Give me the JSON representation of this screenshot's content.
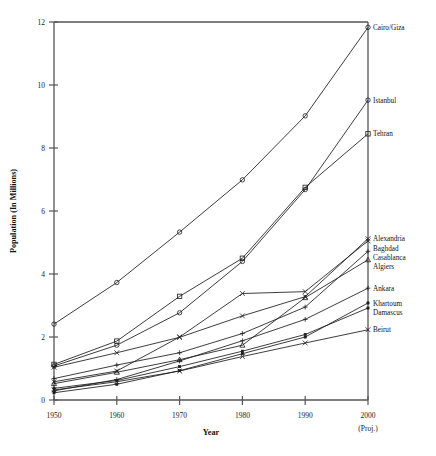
{
  "chart_data": {
    "type": "line",
    "title": "",
    "xlabel": "Year",
    "ylabel": "Population (In Millions)",
    "x": [
      1950,
      1960,
      1970,
      1980,
      1990,
      2000
    ],
    "xtick_labels": [
      "1950",
      "1960",
      "1970",
      "1980",
      "1990",
      "2000"
    ],
    "xtick_sublabel_last": "(Proj.)",
    "ytick_labels": [
      "0",
      "2",
      "4",
      "6",
      "8",
      "10",
      "12"
    ],
    "ytick_values": [
      0,
      2,
      4,
      6,
      8,
      10,
      12
    ],
    "ylim": [
      0,
      12
    ],
    "xlim": [
      1950,
      2000
    ],
    "grid": false,
    "legend_position": "right-of-plot-endpoint-labels",
    "series": [
      {
        "name": "Cairo/Giza",
        "label": "Cairo/Giza",
        "marker": "circle",
        "values": [
          2.41,
          3.73,
          5.33,
          6.99,
          9.02,
          11.83
        ]
      },
      {
        "name": "Istanbul",
        "label": "Istanbul",
        "marker": "circle",
        "values": [
          1.08,
          1.74,
          2.77,
          4.4,
          6.68,
          9.52
        ]
      },
      {
        "name": "Tehran",
        "label": "Tehran",
        "marker": "square",
        "values": [
          1.13,
          1.87,
          3.29,
          4.5,
          6.75,
          8.45
        ]
      },
      {
        "name": "Alexandria",
        "label": "Alexandria",
        "marker": "cross",
        "values": [
          1.04,
          1.5,
          1.99,
          2.67,
          3.28,
          5.12
        ]
      },
      {
        "name": "Baghdad",
        "label": "Baghdad",
        "marker": "cross",
        "values": [
          0.58,
          0.92,
          2.0,
          3.38,
          3.44,
          5.05
        ]
      },
      {
        "name": "Casablanca",
        "label": "Casablanca",
        "marker": "plus",
        "values": [
          0.68,
          1.11,
          1.5,
          2.11,
          2.95,
          4.72
        ]
      },
      {
        "name": "Algiers",
        "label": "Algiers",
        "marker": "triangle",
        "values": [
          0.52,
          0.88,
          1.28,
          1.74,
          3.25,
          4.45
        ]
      },
      {
        "name": "Ankara",
        "label": "Ankara",
        "marker": "plus",
        "values": [
          0.29,
          0.65,
          1.24,
          1.88,
          2.56,
          3.55
        ]
      },
      {
        "name": "Khartoum",
        "label": "Khartoum",
        "marker": "dot",
        "values": [
          0.23,
          0.5,
          0.93,
          1.47,
          2.0,
          3.08
        ]
      },
      {
        "name": "Damascus",
        "label": "Damascus",
        "marker": "dot",
        "values": [
          0.37,
          0.62,
          1.06,
          1.55,
          2.08,
          2.92
        ]
      },
      {
        "name": "Beirut",
        "label": "Beirut",
        "marker": "cross",
        "values": [
          0.32,
          0.58,
          0.92,
          1.38,
          1.81,
          2.23
        ]
      }
    ]
  },
  "axis": {
    "y_title": "Population (In Millions)",
    "x_title": "Year"
  }
}
